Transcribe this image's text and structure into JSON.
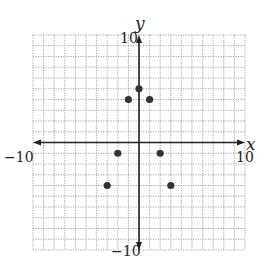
{
  "chart_data": {
    "type": "scatter",
    "title": "",
    "xlabel": "x",
    "ylabel": "y",
    "xlim": [
      -10,
      10
    ],
    "ylim": [
      -10,
      10
    ],
    "grid": true,
    "grid_step": 1,
    "grid_style": "dotted",
    "tick_labels": {
      "x_min": "−10",
      "x_max": "10",
      "y_min": "−10",
      "y_max": "10"
    },
    "points": [
      {
        "x": 0,
        "y": 5
      },
      {
        "x": -1,
        "y": 4
      },
      {
        "x": 1,
        "y": 4
      },
      {
        "x": -2,
        "y": -1
      },
      {
        "x": 2,
        "y": -1
      },
      {
        "x": -3,
        "y": -4
      },
      {
        "x": 3,
        "y": -4
      }
    ],
    "legend": null
  },
  "colors": {
    "grid": "#8a8a8a",
    "axis": "#222222",
    "point": "#333333",
    "background": "#ffffff"
  }
}
